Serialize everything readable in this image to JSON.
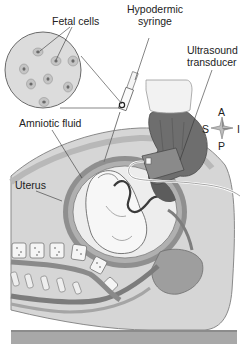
{
  "diagram": {
    "labels": {
      "fetal_cells": "Fetal cells",
      "hypodermic_syringe_line1": "Hypodermic",
      "hypodermic_syringe_line2": "syringe",
      "ultrasound_line1": "Ultrasound",
      "ultrasound_line2": "transducer",
      "amniotic_fluid": "Amniotic fluid",
      "uterus": "Uterus"
    },
    "compass": {
      "top": "A",
      "bottom": "P",
      "left": "S",
      "right": "I"
    },
    "colors": {
      "background": "#ffffff",
      "body_tissue": "#d8d8d8",
      "uterus_wall": "#9a9a9a",
      "amniotic_fluid": "#ececec",
      "fetus": "#f4f4f4",
      "hand": "#6e6e6e",
      "transducer": "#f0f0f0",
      "table": "#a8a8a8",
      "text": "#222222",
      "line": "#333333"
    }
  }
}
